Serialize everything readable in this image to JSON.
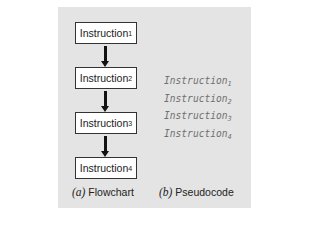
{
  "flowchart": {
    "boxes": [
      {
        "label": "Instruction",
        "sub": "1"
      },
      {
        "label": "Instruction",
        "sub": "2"
      },
      {
        "label": "Instruction",
        "sub": "3"
      },
      {
        "label": "Instruction",
        "sub": "4"
      }
    ],
    "caption_letter": "(a)",
    "caption_text": "Flowchart"
  },
  "pseudocode": {
    "lines": [
      {
        "label": "Instruction",
        "sub": "1"
      },
      {
        "label": "Instruction",
        "sub": "2"
      },
      {
        "label": "Instruction",
        "sub": "3"
      },
      {
        "label": "Instruction",
        "sub": "4"
      }
    ],
    "caption_letter": "(b)",
    "caption_text": "Pseudocode"
  },
  "colors": {
    "panel_background": "#e4e4e4",
    "box_fill": "#ffffff",
    "pseudocode_text": "#707070",
    "arrow": "#111111"
  }
}
